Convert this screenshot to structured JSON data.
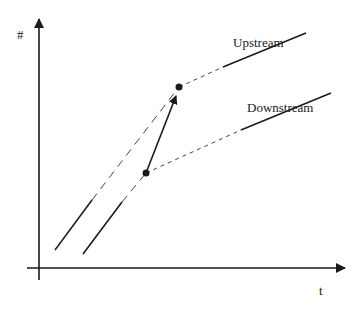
{
  "diagram": {
    "axes": {
      "y_label": "#",
      "x_label": "t"
    },
    "series": [
      {
        "name": "Upstream",
        "label": "Upstream"
      },
      {
        "name": "Downstream",
        "label": "Downstream"
      }
    ],
    "colors": {
      "line": "#1a1a1a",
      "background": "#ffffff"
    }
  }
}
